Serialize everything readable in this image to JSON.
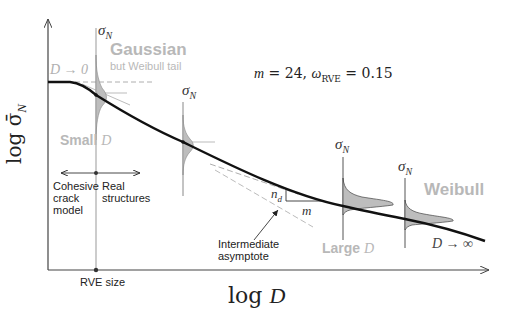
{
  "axes": {
    "ylabel": "log σ̄",
    "ylabel_sub": "N",
    "xlabel_log": "log",
    "xlabel_var": "D"
  },
  "params": {
    "m_label": "m",
    "m_value": "= 24,",
    "omega_label": "ω",
    "omega_sub": "RVE",
    "omega_value": "= 0.15"
  },
  "distribution_labels": {
    "sigma": "σ",
    "sub": "N"
  },
  "regions": {
    "gaussian": "Gaussian",
    "gaussian_note": "but Weibull tail",
    "small_d": "Small",
    "large_d": "Large",
    "d_var": "D",
    "weibull": "Weibull"
  },
  "limits": {
    "d_to_zero": "D → 0",
    "d_to_inf": "D → ∞"
  },
  "annotations": {
    "cohesive": [
      "Cohesive",
      "crack",
      "model"
    ],
    "real": [
      "Real",
      "structures"
    ],
    "intermediate": [
      "Intermediate",
      "asymptote"
    ],
    "rve_size": "RVE size",
    "slope_nd": "n",
    "slope_nd_sub": "d",
    "slope_m": "m"
  },
  "colors": {
    "curve": "#111111",
    "axis": "#444444",
    "dist_fill": "#bdbdbd",
    "faded_text": "#b8b8b8",
    "dashed": "#9a9a9a"
  }
}
